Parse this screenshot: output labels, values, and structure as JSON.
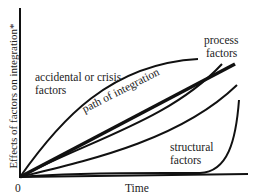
{
  "diagram": {
    "y_axis_label": "Effects of factors on integration*",
    "x_axis_label": "Time",
    "origin_label": "0",
    "curves": [
      {
        "name": "accidental-or-crisis-factors",
        "label_line1": "accidental or crisis",
        "label_line2": "factors"
      },
      {
        "name": "process-factors",
        "label_line1": "process",
        "label_line2": "factors"
      },
      {
        "name": "path-of-integration",
        "label": "path of integration"
      },
      {
        "name": "structural-factors",
        "label_line1": "structural",
        "label_line2": "factors"
      }
    ]
  }
}
